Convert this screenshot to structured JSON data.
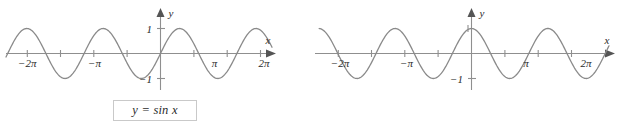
{
  "figure": {
    "background_color": "#ffffff",
    "curve_color": "#8a8a8a",
    "axis_color": "#8f8f8f",
    "text_color": "#2b2b2b",
    "caption_border_color": "#c9c9c9"
  },
  "panels": [
    {
      "id": "sin",
      "caption": "y = sin x",
      "axis_label_x": "x",
      "axis_label_y": "y",
      "y_tick_labels": [
        "1",
        "-1"
      ],
      "x_tick_labels": [
        "-2π",
        "-π",
        "π",
        "2π"
      ]
    },
    {
      "id": "cos",
      "caption": "y = cos x",
      "axis_label_x": "x",
      "axis_label_y": "y",
      "y_tick_labels": [
        "-1"
      ],
      "x_tick_labels": [
        "-2π",
        "-π",
        "π",
        "2π"
      ]
    }
  ],
  "chart_data": [
    {
      "type": "line",
      "id": "sin",
      "title": "y = sin x",
      "function": "sin",
      "xlabel": "x",
      "ylabel": "y",
      "xlim": [
        -7.85,
        7.85
      ],
      "ylim": [
        -1.45,
        1.45
      ],
      "grid": false,
      "legend": "none",
      "x_ticks": [
        -6.2832,
        -4.7124,
        -3.1416,
        -1.5708,
        1.5708,
        3.1416,
        4.7124,
        6.2832
      ],
      "x_tick_labels": [
        "-2π",
        "",
        "-π",
        "",
        "",
        "π",
        "",
        "2π"
      ],
      "y_ticks": [
        -1,
        1
      ],
      "y_tick_labels": [
        "-1",
        "1"
      ],
      "series": [
        {
          "name": "y = sin x",
          "x": [
            -7.854,
            -7.461,
            -7.069,
            -6.676,
            -6.283,
            -5.89,
            -5.498,
            -5.105,
            -4.712,
            -4.32,
            -3.927,
            -3.534,
            -3.142,
            -2.749,
            -2.356,
            -1.963,
            -1.571,
            -1.178,
            -0.785,
            -0.393,
            0.0,
            0.393,
            0.785,
            1.178,
            1.571,
            1.963,
            2.356,
            2.749,
            3.142,
            3.534,
            3.927,
            4.32,
            4.712,
            5.105,
            5.498,
            5.89,
            6.283,
            6.676,
            7.069,
            7.461,
            7.854
          ],
          "y": [
            -1.0,
            -0.924,
            -0.707,
            -0.383,
            0.0,
            0.383,
            0.707,
            0.924,
            1.0,
            0.924,
            0.707,
            0.383,
            0.0,
            -0.383,
            -0.707,
            -0.924,
            -1.0,
            -0.924,
            -0.707,
            -0.383,
            0.0,
            0.383,
            0.707,
            0.924,
            1.0,
            0.924,
            0.707,
            0.383,
            0.0,
            -0.383,
            -0.707,
            -0.924,
            -1.0,
            -0.924,
            -0.707,
            -0.383,
            0.0,
            0.383,
            0.707,
            0.924,
            1.0
          ]
        }
      ]
    },
    {
      "type": "line",
      "id": "cos",
      "title": "y = cos x",
      "function": "cos",
      "xlabel": "x",
      "ylabel": "y",
      "xlim": [
        -7.85,
        7.85
      ],
      "ylim": [
        -1.45,
        1.45
      ],
      "grid": false,
      "legend": "none",
      "x_ticks": [
        -6.2832,
        -4.7124,
        -3.1416,
        -1.5708,
        1.5708,
        3.1416,
        4.7124,
        6.2832
      ],
      "x_tick_labels": [
        "-2π",
        "",
        "-π",
        "",
        "",
        "π",
        "",
        "2π"
      ],
      "y_ticks": [
        -1,
        1
      ],
      "y_tick_labels": [
        "-1",
        ""
      ],
      "series": [
        {
          "name": "y = cos x",
          "x": [
            -7.854,
            -7.461,
            -7.069,
            -6.676,
            -6.283,
            -5.89,
            -5.498,
            -5.105,
            -4.712,
            -4.32,
            -3.927,
            -3.534,
            -3.142,
            -2.749,
            -2.356,
            -1.963,
            -1.571,
            -1.178,
            -0.785,
            -0.393,
            0.0,
            0.393,
            0.785,
            1.178,
            1.571,
            1.963,
            2.356,
            2.749,
            3.142,
            3.534,
            3.927,
            4.32,
            4.712,
            5.105,
            5.498,
            5.89,
            6.283,
            6.676,
            7.069,
            7.461,
            7.854
          ],
          "y": [
            0.0,
            0.383,
            0.707,
            0.924,
            1.0,
            0.924,
            0.707,
            0.383,
            0.0,
            -0.383,
            -0.707,
            -0.924,
            -1.0,
            -0.924,
            -0.707,
            -0.383,
            0.0,
            0.383,
            0.707,
            0.924,
            1.0,
            0.924,
            0.707,
            0.383,
            0.0,
            -0.383,
            -0.707,
            -0.924,
            -1.0,
            -0.924,
            -0.707,
            -0.383,
            0.0,
            0.383,
            0.707,
            0.924,
            1.0,
            0.924,
            0.707,
            0.383,
            0.0
          ]
        }
      ]
    }
  ]
}
